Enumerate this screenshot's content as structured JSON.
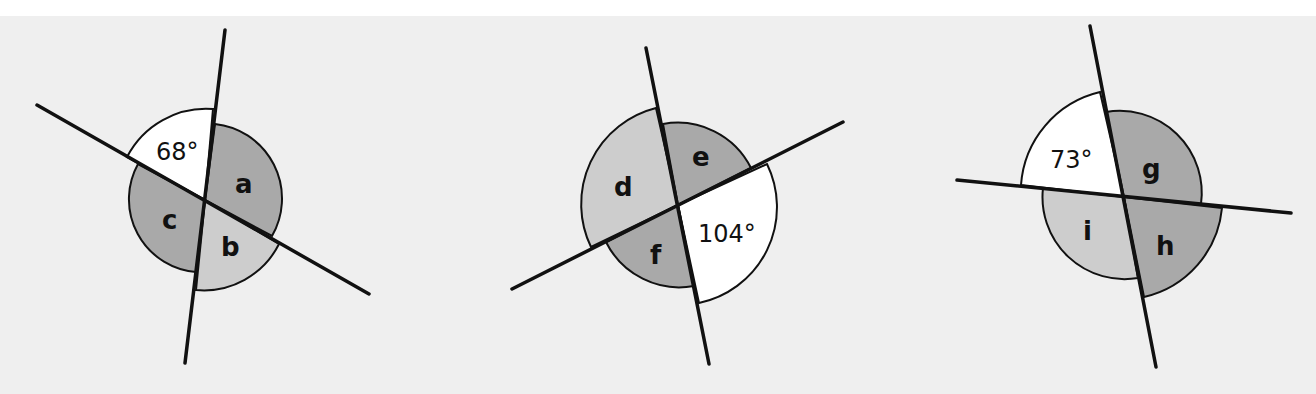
{
  "diagrams": [
    {
      "id": "diagram-1",
      "given_angle": "68°",
      "labels": {
        "a": "a",
        "b": "b",
        "c": "c"
      }
    },
    {
      "id": "diagram-2",
      "given_angle": "104°",
      "labels": {
        "d": "d",
        "e": "e",
        "f": "f"
      }
    },
    {
      "id": "diagram-3",
      "given_angle": "73°",
      "labels": {
        "g": "g",
        "h": "h",
        "i": "i"
      }
    }
  ],
  "colors": {
    "background": "#efefef",
    "white_sector": "#ffffff",
    "dark_sector": "#a9a9a9",
    "light_sector": "#cdcdcd",
    "line": "#111111"
  }
}
